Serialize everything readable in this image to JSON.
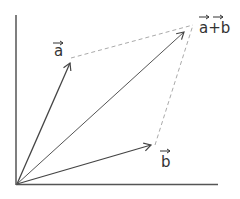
{
  "diagram": {
    "title": "",
    "type": "vector addition parallelogram",
    "colors": {
      "axis": "#555555",
      "vector": "#444444",
      "dashed": "#aaaaaa",
      "label": "#333333"
    },
    "origin": {
      "x": 17,
      "y": 184
    },
    "axes": {
      "x_end": {
        "x": 218,
        "y": 184
      },
      "y_end": {
        "x": 16,
        "y": 15
      }
    },
    "vectors": [
      {
        "id": "a",
        "label": "a",
        "tip": {
          "x": 70,
          "y": 63
        }
      },
      {
        "id": "b",
        "label": "b",
        "tip": {
          "x": 151,
          "y": 145
        }
      },
      {
        "id": "a_plus_b",
        "label": "a+b",
        "tip": {
          "x": 184,
          "y": 32
        }
      }
    ],
    "labels": {
      "a": "a",
      "b": "b",
      "sum": "a+b",
      "arrow_glyph": "→"
    }
  }
}
